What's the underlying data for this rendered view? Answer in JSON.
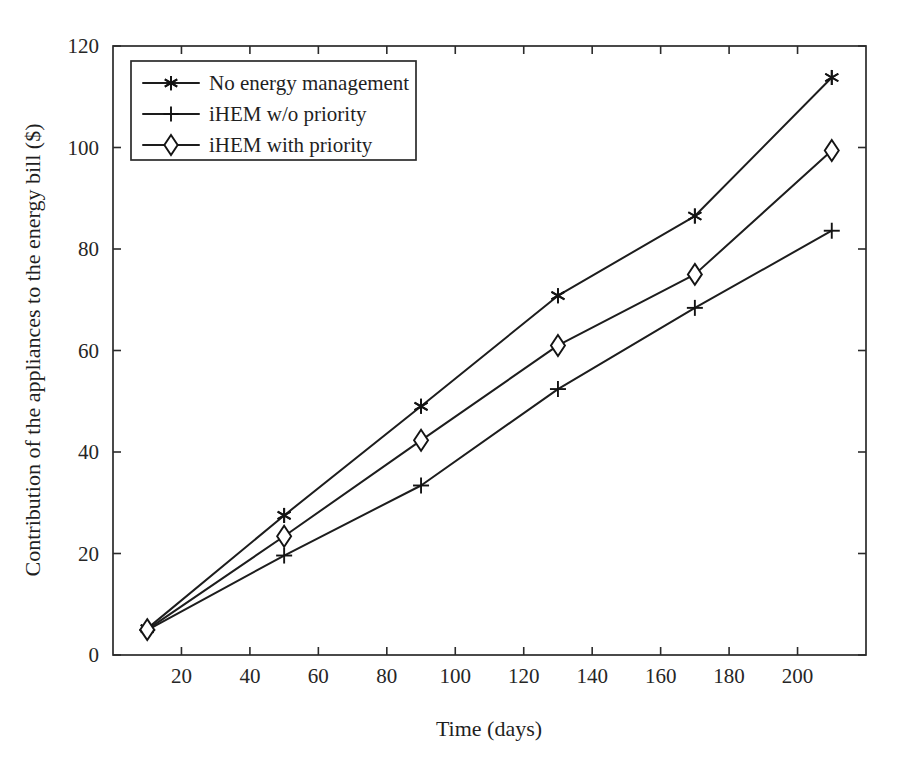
{
  "chart_data": {
    "type": "line",
    "title": "",
    "xlabel": "Time (days)",
    "ylabel": "Contribution of the appliances to the energy bill ($)",
    "xlim": [
      0,
      220
    ],
    "ylim": [
      0,
      120
    ],
    "xticks": [
      20,
      40,
      60,
      80,
      100,
      120,
      140,
      160,
      180,
      200
    ],
    "yticks": [
      0,
      20,
      40,
      60,
      80,
      100,
      120
    ],
    "xtick_labels": [
      "20",
      "40",
      "60",
      "80",
      "100",
      "120",
      "140",
      "160",
      "180",
      "200"
    ],
    "ytick_labels": [
      "0",
      "20",
      "40",
      "60",
      "80",
      "100",
      "120"
    ],
    "grid": false,
    "legend_position": "upper left",
    "x": [
      10,
      50,
      90,
      130,
      170,
      210
    ],
    "series": [
      {
        "name": "No energy management",
        "marker": "star-asterisk",
        "values": [
          5.2,
          27.5,
          49.0,
          70.8,
          86.5,
          113.8
        ]
      },
      {
        "name": "iHEM w/o priority",
        "marker": "plus",
        "values": [
          4.9,
          19.6,
          33.4,
          52.4,
          68.4,
          83.6
        ]
      },
      {
        "name": "iHEM with priority",
        "marker": "diamond",
        "values": [
          5.0,
          23.4,
          42.3,
          61.0,
          75.0,
          99.4
        ]
      }
    ]
  },
  "legend": {
    "items": [
      {
        "label": "No energy management",
        "marker": "star-asterisk"
      },
      {
        "label": "iHEM w/o priority",
        "marker": "plus"
      },
      {
        "label": "iHEM with priority",
        "marker": "diamond"
      }
    ]
  },
  "colors": {
    "line": "#1d1d1d",
    "axis": "#2b2b2b",
    "text": "#1f1f1f",
    "background": "#ffffff"
  }
}
